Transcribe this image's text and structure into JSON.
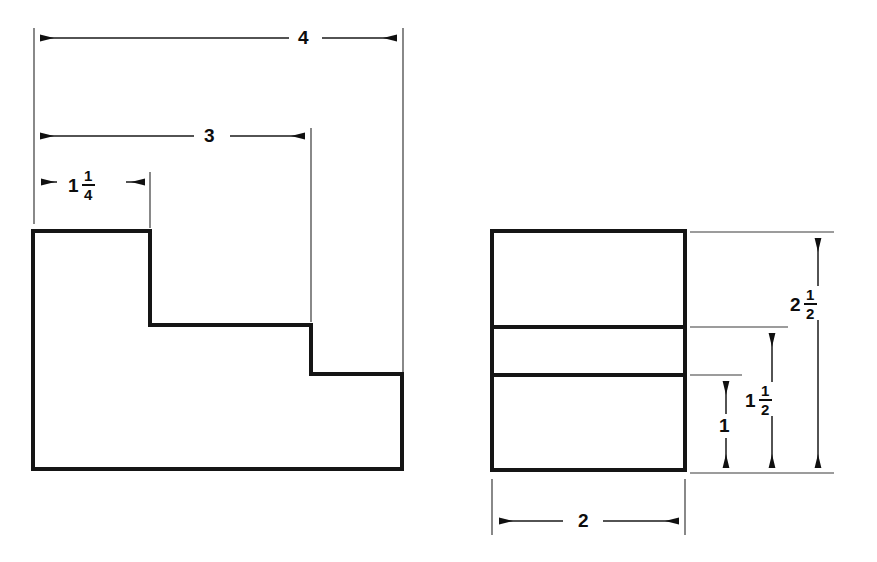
{
  "drawing": {
    "title": "Two-view orthographic drawing of a stepped block",
    "caption": "",
    "line_color": "#151515",
    "extension_line_color": "#3a3a3a",
    "background": "#ffffff",
    "units": "inches",
    "views": [
      {
        "name": "front-view",
        "type": "stepped-profile",
        "outline_points": "33,231 150,231 150,325 311,325 311,374 402,374 402,469 33,469"
      },
      {
        "name": "side-view",
        "type": "rectangle-with-horizontal-divisions",
        "outline_points": "492,231 685,231 685,470 492,470",
        "division_lines_y": [
          327,
          375
        ]
      }
    ],
    "dimensions": [
      {
        "id": "dim-4",
        "label_whole": "4",
        "label_fraction_num": "",
        "label_fraction_den": "",
        "value": 4,
        "orientation": "horizontal",
        "view": "front-view",
        "measures": "overall-width"
      },
      {
        "id": "dim-3",
        "label_whole": "3",
        "label_fraction_num": "",
        "label_fraction_den": "",
        "value": 3,
        "orientation": "horizontal",
        "view": "front-view",
        "measures": "width-to-second-step"
      },
      {
        "id": "dim-1-1-4",
        "label_whole": "1",
        "label_fraction_num": "1",
        "label_fraction_den": "4",
        "value": 1.25,
        "orientation": "horizontal",
        "view": "front-view",
        "measures": "width-to-first-step"
      },
      {
        "id": "dim-2-1-2",
        "label_whole": "2",
        "label_fraction_num": "1",
        "label_fraction_den": "2",
        "value": 2.5,
        "orientation": "vertical",
        "view": "side-view",
        "measures": "overall-height"
      },
      {
        "id": "dim-1-1-2",
        "label_whole": "1",
        "label_fraction_num": "1",
        "label_fraction_den": "2",
        "value": 1.5,
        "orientation": "vertical",
        "view": "side-view",
        "measures": "height-to-upper-division"
      },
      {
        "id": "dim-1",
        "label_whole": "1",
        "label_fraction_num": "",
        "label_fraction_den": "",
        "value": 1,
        "orientation": "vertical",
        "view": "side-view",
        "measures": "height-to-lower-division"
      },
      {
        "id": "dim-2-bottom",
        "label_whole": "2",
        "label_fraction_num": "",
        "label_fraction_den": "",
        "value": 2,
        "orientation": "horizontal",
        "view": "side-view",
        "measures": "overall-depth"
      }
    ]
  }
}
